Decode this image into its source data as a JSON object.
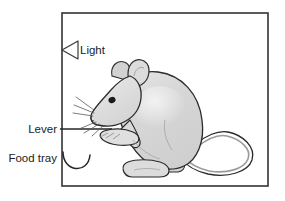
{
  "figure": {
    "background_color": "#ffffff",
    "line_color": "#262626",
    "chamber": {
      "name": "chamber-box",
      "x": 62,
      "y": 13,
      "width": 206,
      "height": 173,
      "stroke": "#333333",
      "stroke_width": 1.6
    },
    "labels": [
      {
        "id": "light",
        "text": "Light",
        "x": 79,
        "y": 50,
        "anchor": "start",
        "icon": "light-triangle-icon"
      },
      {
        "id": "lever",
        "text": "Lever",
        "x": 57,
        "y": 132,
        "anchor": "end",
        "icon": "lever-line-icon"
      },
      {
        "id": "food_tray",
        "text": "Food tray",
        "x": 57,
        "y": 161,
        "anchor": "end",
        "icon": "food-tray-arc-icon"
      }
    ],
    "mouse": {
      "name": "mouse-illustration",
      "body_fill": "#d6d6d6",
      "highlight_fill": "#ececec",
      "outline": "#2b2b2b",
      "ear_fill": "#d9d9d9",
      "eye_fill": "#1a1a1a",
      "tail_fill": "#d2d2d2",
      "paw_fill": "#dcdcdc"
    }
  }
}
